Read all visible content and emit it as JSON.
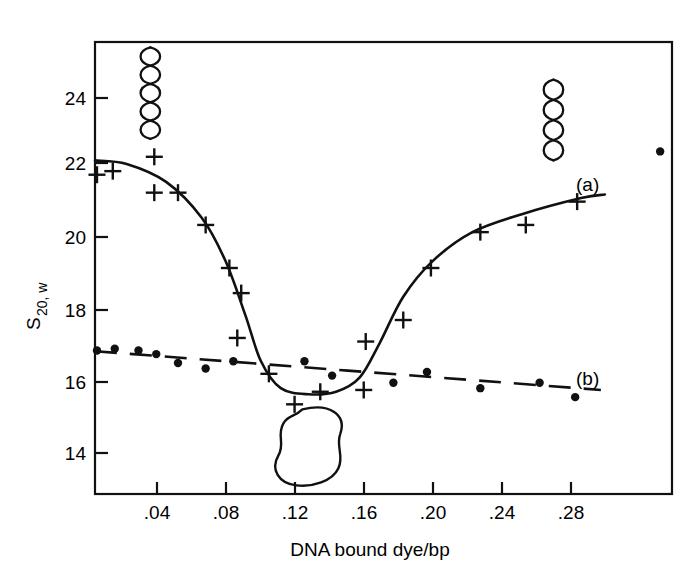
{
  "figure": {
    "background_color": "#ffffff",
    "ink_color": "#111111"
  },
  "chart_data": {
    "type": "scatter",
    "title": "",
    "subtitle": "",
    "xlabel": "DNA bound  dye/bp",
    "ylabel": "S20, w",
    "ylabel_parts": {
      "base": "S",
      "subscript": "20, w"
    },
    "xlim": [
      0.004,
      0.296
    ],
    "ylim": [
      13.0,
      25.6
    ],
    "xticks": [
      0.04,
      0.08,
      0.12,
      0.16,
      0.2,
      0.24,
      0.28
    ],
    "xticklabels": [
      ".04",
      ".08",
      ".12",
      ".16",
      ".20",
      ".24",
      ".28"
    ],
    "yticks": [
      14,
      16,
      18,
      20,
      22,
      24
    ],
    "yticklabels": [
      "14",
      "16",
      "18",
      "20",
      "22",
      "24"
    ],
    "grid": false,
    "legend_position": "inline-right",
    "series": [
      {
        "name": "(a)",
        "label": "(a)",
        "marker": "plus",
        "line_style": "solid",
        "description": "supercoiled DNA sedimentation coefficient vs bound dye",
        "points": [
          {
            "x": 0.005,
            "y": 21.9
          },
          {
            "x": 0.013,
            "y": 22.0
          },
          {
            "x": 0.034,
            "y": 22.4
          },
          {
            "x": 0.034,
            "y": 21.4
          },
          {
            "x": 0.046,
            "y": 21.4
          },
          {
            "x": 0.06,
            "y": 20.5
          },
          {
            "x": 0.072,
            "y": 19.3
          },
          {
            "x": 0.078,
            "y": 18.6
          },
          {
            "x": 0.076,
            "y": 17.35
          },
          {
            "x": 0.092,
            "y": 16.35
          },
          {
            "x": 0.105,
            "y": 15.5
          },
          {
            "x": 0.118,
            "y": 15.85
          },
          {
            "x": 0.14,
            "y": 15.9
          },
          {
            "x": 0.141,
            "y": 17.25
          },
          {
            "x": 0.16,
            "y": 17.85
          },
          {
            "x": 0.174,
            "y": 19.3
          },
          {
            "x": 0.199,
            "y": 20.3
          },
          {
            "x": 0.222,
            "y": 20.5
          },
          {
            "x": 0.248,
            "y": 21.15
          }
        ],
        "fit_curve": [
          {
            "x": 0.004,
            "y": 22.3
          },
          {
            "x": 0.02,
            "y": 22.2
          },
          {
            "x": 0.04,
            "y": 21.7
          },
          {
            "x": 0.058,
            "y": 20.7
          },
          {
            "x": 0.07,
            "y": 19.5
          },
          {
            "x": 0.08,
            "y": 18.0
          },
          {
            "x": 0.088,
            "y": 16.7
          },
          {
            "x": 0.098,
            "y": 15.95
          },
          {
            "x": 0.112,
            "y": 15.78
          },
          {
            "x": 0.126,
            "y": 15.85
          },
          {
            "x": 0.138,
            "y": 16.25
          },
          {
            "x": 0.148,
            "y": 17.2
          },
          {
            "x": 0.16,
            "y": 18.5
          },
          {
            "x": 0.175,
            "y": 19.5
          },
          {
            "x": 0.195,
            "y": 20.3
          },
          {
            "x": 0.22,
            "y": 20.8
          },
          {
            "x": 0.25,
            "y": 21.25
          },
          {
            "x": 0.262,
            "y": 21.35
          }
        ]
      },
      {
        "name": "(b)",
        "label": "(b)",
        "marker": "dot",
        "line_style": "dashed",
        "description": "nicked / relaxed DNA sedimentation coefficient vs bound dye",
        "points": [
          {
            "x": 0.005,
            "y": 17.0
          },
          {
            "x": 0.014,
            "y": 17.05
          },
          {
            "x": 0.026,
            "y": 17.0
          },
          {
            "x": 0.035,
            "y": 16.9
          },
          {
            "x": 0.046,
            "y": 16.65
          },
          {
            "x": 0.06,
            "y": 16.5
          },
          {
            "x": 0.074,
            "y": 16.7
          },
          {
            "x": 0.11,
            "y": 16.7
          },
          {
            "x": 0.124,
            "y": 16.3
          },
          {
            "x": 0.155,
            "y": 16.1
          },
          {
            "x": 0.172,
            "y": 16.4
          },
          {
            "x": 0.199,
            "y": 15.95
          },
          {
            "x": 0.229,
            "y": 16.1
          },
          {
            "x": 0.247,
            "y": 15.7
          },
          {
            "x": 0.29,
            "y": 22.55
          }
        ],
        "fit_curve": [
          {
            "x": 0.004,
            "y": 16.98
          },
          {
            "x": 0.26,
            "y": 15.9
          }
        ]
      }
    ],
    "annotations": [
      {
        "name": "supercoiled-dna-icon-left",
        "type": "helix",
        "x": 0.032,
        "y_top": 25.45,
        "y_bottom": 22.9,
        "loops": 5,
        "description": "supercoiled DNA helix schematic"
      },
      {
        "name": "supercoiled-dna-icon-right",
        "type": "helix",
        "x": 0.236,
        "y_top": 24.55,
        "y_bottom": 22.3,
        "loops": 4,
        "description": "less supercoiled DNA helix schematic"
      },
      {
        "name": "relaxed-dna-icon",
        "type": "blob",
        "x": 0.112,
        "y": 14.3,
        "description": "relaxed open circular DNA schematic"
      }
    ]
  }
}
